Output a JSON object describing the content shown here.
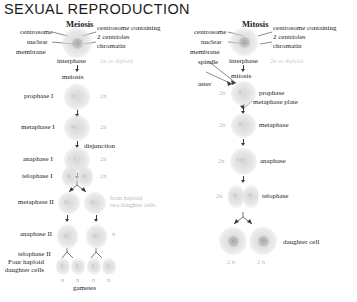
{
  "title": "SEXUAL REPRODUCTION",
  "columns": {
    "meiosis": {
      "heading": "Meiosis",
      "annotations": {
        "centrosome": "centrosome",
        "nuclear": "nuclear",
        "membrane": "membrane",
        "centrosome_containing": "centrosome containing",
        "two_centrioles": "2 centrioles",
        "chromatin": "chromatin"
      },
      "stages": [
        {
          "name": "interphase",
          "ploidy": "2n or diploid"
        },
        {
          "name": "meiosis",
          "ploidy": ""
        },
        {
          "name": "prophase I",
          "ploidy": "2n"
        },
        {
          "name": "metaphase I",
          "ploidy": "2n"
        },
        {
          "name": "anaphase I",
          "ploidy": "2n"
        },
        {
          "name": "telophase I",
          "ploidy": "2n"
        },
        {
          "name": "metaphase II",
          "ploidy": "n"
        },
        {
          "name": "anaphase II",
          "ploidy": "n"
        },
        {
          "name": "telophase II",
          "ploidy": ""
        },
        {
          "name": "Four haploid daughter cells",
          "ploidy": "n"
        }
      ],
      "disjunction_label": "disjunction",
      "daughter_note": "from haploid\ntwo daughter cells",
      "daughter_note_line1": "from haploid",
      "daughter_note_line2": "two daughter cells",
      "gametes_label": "gametes",
      "gamete_ploidy": [
        "n",
        "n",
        "n",
        "n"
      ],
      "four_haploid_line1": "Four haploid",
      "four_haploid_line2": "daughter cells"
    },
    "mitosis": {
      "heading": "Mitosis",
      "annotations": {
        "centrosome": "centrosome",
        "nuclear": "nuclear",
        "membrane": "membrane",
        "spindle": "spindle",
        "aster": "aster",
        "centrosome_containing": "centrosome containing",
        "two_centrioles": "2 centrioles",
        "chromatin": "chromatin",
        "metaphase_plate": "metaphase plate"
      },
      "stages": [
        {
          "name": "interphase",
          "ploidy": "2n or diploid"
        },
        {
          "name": "mitosis",
          "ploidy": ""
        },
        {
          "name": "prophase",
          "ploidy": "2n"
        },
        {
          "name": "metaphase",
          "ploidy": "2n"
        },
        {
          "name": "anaphase",
          "ploidy": "2n"
        },
        {
          "name": "telophase",
          "ploidy": "2n"
        },
        {
          "name": "daughter cell",
          "ploidy": "2n"
        }
      ],
      "daughter_ploidy": [
        "2 n",
        "2 n"
      ]
    }
  },
  "colors": {
    "title": "#1b1b1b",
    "text": "#242424",
    "faint": "#9e9e9e",
    "cell": "#d5d5d5",
    "line": "#3a3a3a"
  }
}
